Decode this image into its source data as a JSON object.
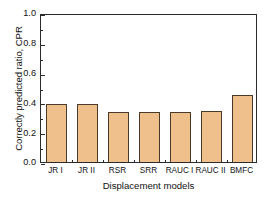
{
  "chart_data": {
    "type": "bar",
    "title": "",
    "xlabel": "Displacement models",
    "ylabel": "Correctly predicted ratio, CPR",
    "categories": [
      "JR I",
      "JR II",
      "RSR",
      "SRR",
      "RAUC I",
      "RAUC II",
      "BMFC"
    ],
    "values": [
      0.392,
      0.392,
      0.335,
      0.333,
      0.334,
      0.343,
      0.449
    ],
    "ylim": [
      0.0,
      1.0
    ],
    "ytick_labels": [
      "0.0",
      "0.2",
      "0.4",
      "0.6",
      "0.8",
      "1.0"
    ],
    "ytick_values": [
      0.0,
      0.2,
      0.4,
      0.6,
      0.8,
      1.0
    ],
    "yminor_values": [
      0.1,
      0.3,
      0.5,
      0.7,
      0.9
    ],
    "grid": false,
    "legend": "none",
    "bar_fill_color": "#efc08c",
    "bar_edge_color": "#4a3a28",
    "axis_color": "#2b2b2b",
    "background_color": "#ffffff"
  }
}
